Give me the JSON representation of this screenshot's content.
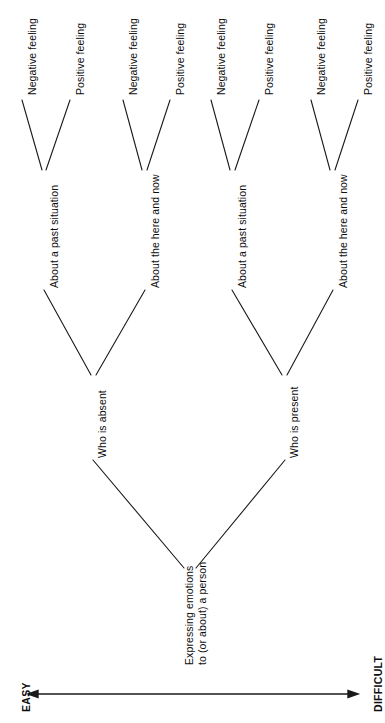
{
  "diagram": {
    "orientation": "rotated-90-ccw",
    "line_color": "#1a1a1a",
    "text_color": "#0d0d0d",
    "background": "#ffffff",
    "root": {
      "line1": "Expressing emotions",
      "line2": "to (or about) a person"
    },
    "level2": [
      {
        "label": "Who is absent"
      },
      {
        "label": "Who is present"
      }
    ],
    "level3": [
      {
        "label": "About a past situation"
      },
      {
        "label": "About the here and now"
      },
      {
        "label": "About a past situation"
      },
      {
        "label": "About the here and now"
      }
    ],
    "leaves": [
      {
        "label": "Negative feeling"
      },
      {
        "label": "Positive feeling"
      },
      {
        "label": "Negative feeling"
      },
      {
        "label": "Positive feeling"
      },
      {
        "label": "Negative feeling"
      },
      {
        "label": "Positive feeling"
      },
      {
        "label": "Negative feeling"
      },
      {
        "label": "Positive feeling"
      }
    ],
    "axis": {
      "left_label": "EASY",
      "right_label": "DIFFICULT"
    }
  }
}
